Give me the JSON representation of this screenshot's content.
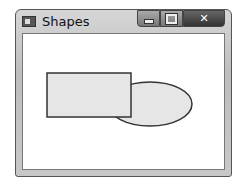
{
  "window": {
    "title": "Shapes",
    "controls": {
      "minimize": "–",
      "maximize": "□",
      "close": "✕"
    }
  },
  "canvas": {
    "shapes": [
      {
        "type": "ellipse",
        "cx": 150,
        "cy": 104,
        "rx": 42,
        "ry": 22,
        "fill": "#e6e6e6",
        "stroke": "#333333"
      },
      {
        "type": "rectangle",
        "x": 47,
        "y": 73,
        "width": 84,
        "height": 44,
        "fill": "#e6e6e6",
        "stroke": "#333333"
      }
    ]
  }
}
